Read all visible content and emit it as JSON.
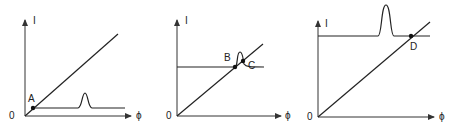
{
  "panels": [
    {
      "id": "panel-1",
      "y_axis_label": "I",
      "x_axis_label": "ϕ",
      "origin_label": "0",
      "points": [
        {
          "label": "A"
        }
      ],
      "description": "Diagonal line from origin; low horizontal line with peak far right; intersection A near origin"
    },
    {
      "id": "panel-2",
      "y_axis_label": "I",
      "x_axis_label": "ϕ",
      "origin_label": "0",
      "points": [
        {
          "label": "B"
        },
        {
          "label": "C"
        }
      ],
      "description": "Diagonal line from origin; mid-level horizontal line with peak; intersections B and C near peak"
    },
    {
      "id": "panel-3",
      "y_axis_label": "I",
      "x_axis_label": "ϕ",
      "origin_label": "0",
      "points": [
        {
          "label": "D"
        }
      ],
      "description": "Diagonal line from origin; high horizontal line with tall peak; intersection D right of peak"
    }
  ]
}
